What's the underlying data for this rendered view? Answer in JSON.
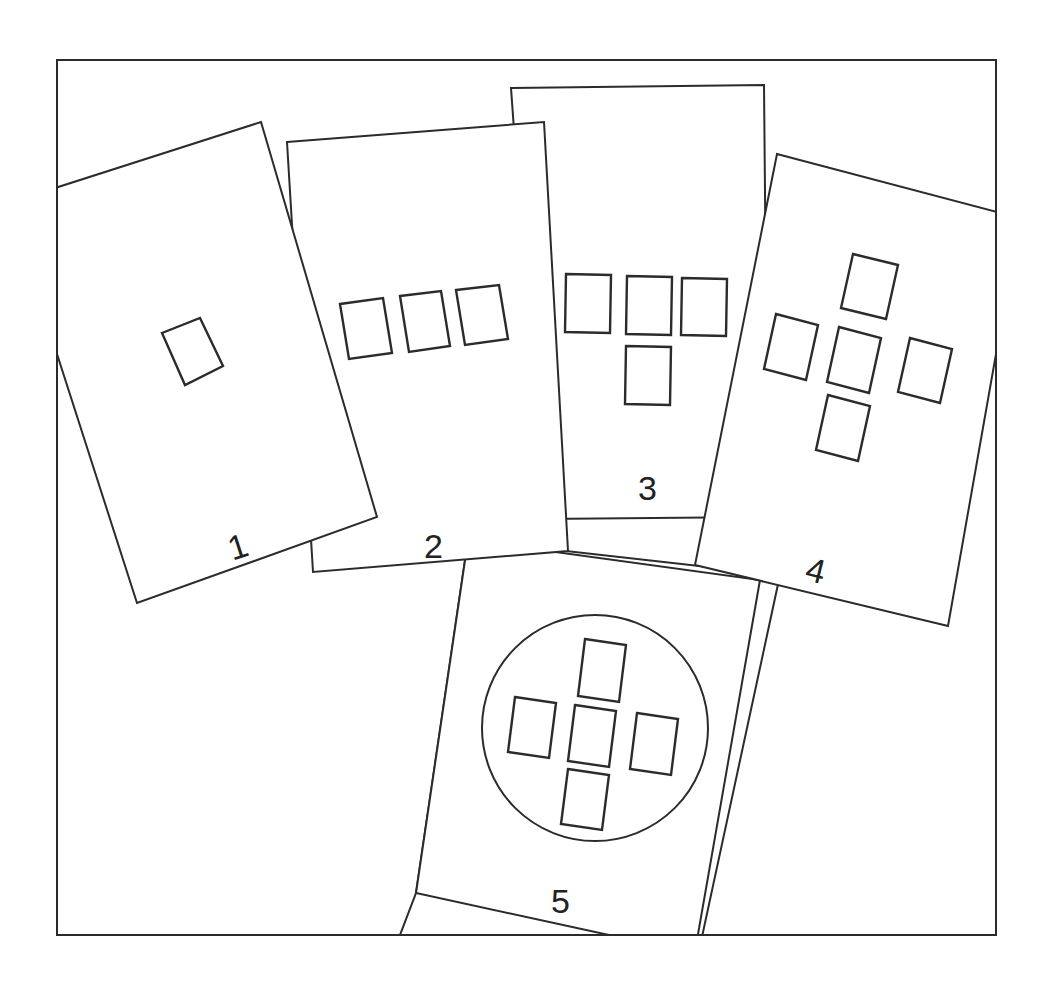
{
  "diagram": {
    "colors": {
      "line": "#2b2b2b",
      "background": "#ffffff",
      "text": "#222222"
    },
    "cards": [
      {
        "id": 1,
        "label": "1",
        "pattern": "single tilted rectangle"
      },
      {
        "id": 2,
        "label": "2",
        "pattern": "three rectangles in a row"
      },
      {
        "id": 3,
        "label": "3",
        "pattern": "three rectangles in a row with one below center (T shape)"
      },
      {
        "id": 4,
        "label": "4",
        "pattern": "five rectangles in a plus/cross shape"
      },
      {
        "id": 5,
        "label": "5",
        "pattern": "five rectangles in a plus/cross shape inside a circle"
      }
    ]
  }
}
